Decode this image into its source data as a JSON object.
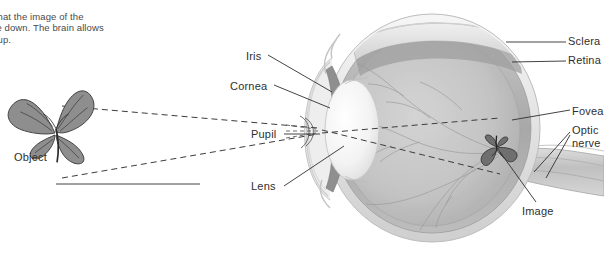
{
  "figure": {
    "caption": "te that the image of the\nside down. The brain allows\nde up."
  },
  "labels": {
    "iris": "Iris",
    "cornea": "Cornea",
    "pupil": "Pupil",
    "lens": "Lens",
    "object": "Object",
    "image": "Image",
    "sclera": "Sclera",
    "retina": "Retina",
    "fovea": "Fovea",
    "optic_nerve": "Optic nerve"
  },
  "colors": {
    "background": "#ffffff",
    "sclera": "#e9e9e9",
    "choroid": "#b6b6b6",
    "vitreous": "#c6c6c6",
    "vitreous_dark": "#aeaeae",
    "lens": "#f4f4f4",
    "cornea": "#d8d8d8",
    "leader_line": "#2f2f2f",
    "ray": "#3c3c3c",
    "text": "#2f2f2f",
    "vessel": "#9a9a9a"
  }
}
